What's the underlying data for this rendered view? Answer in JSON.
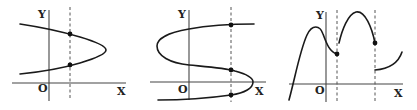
{
  "figures": [
    {
      "id": "graph-1",
      "axis_labels": {
        "y": "Y",
        "x": "X",
        "origin": "O"
      },
      "description": "Sideways parabola opening left; vertical dashed line intersects it at two points"
    },
    {
      "id": "graph-2",
      "axis_labels": {
        "y": "Y",
        "x": "X",
        "origin": "O"
      },
      "description": "S-shaped curve; vertical dashed line intersects it at three points"
    },
    {
      "id": "graph-3",
      "axis_labels": {
        "y": "Y",
        "x": "X",
        "origin": "O"
      },
      "description": "Piecewise curve with two vertical dashed lines at discontinuities"
    }
  ]
}
